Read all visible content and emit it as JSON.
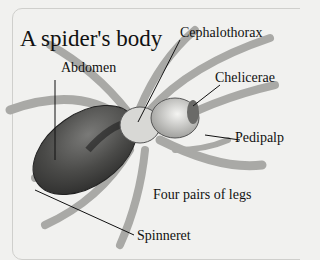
{
  "title": "A spider's body",
  "labels": {
    "abdomen": "Abdomen",
    "cephalothorax": "Cephalothorax",
    "chelicerae": "Chelicerae",
    "pedipalp": "Pedipalp",
    "legs": "Four pairs of legs",
    "spinneret": "Spinneret"
  },
  "colors": {
    "background": "#f1f1ef",
    "abdomen": "#4a4a4a",
    "leg": "#b9b9b6",
    "text": "#111111"
  }
}
